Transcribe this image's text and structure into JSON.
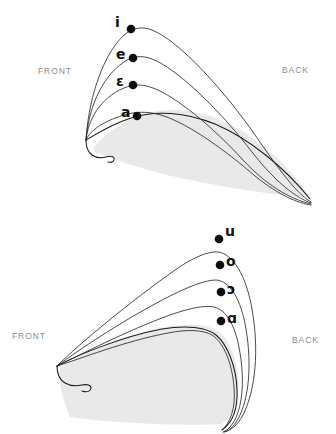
{
  "figure": {
    "background_color": "#ffffff",
    "tongue_fill_color": "#e9e9e9",
    "outline_color": "#1a1a1a",
    "curve_color": "#2a2a2a",
    "dot_color": "#0d0d0d",
    "orientation_label_color": "#8d8d8d",
    "vowel_label_color": "#101010"
  },
  "panels": [
    {
      "id": "front-vowels",
      "name": "Front vowel tongue positions",
      "orientation": {
        "front_label": "FRONT",
        "back_label": "BACK"
      },
      "vowels": [
        {
          "symbol": "i",
          "dot_x": 131,
          "dot_y": 29,
          "label_x": 115,
          "label_y": 15
        },
        {
          "symbol": "e",
          "dot_x": 133,
          "dot_y": 58,
          "label_x": 116,
          "label_y": 47
        },
        {
          "symbol": "ɛ",
          "dot_x": 133,
          "dot_y": 85,
          "label_x": 117,
          "label_y": 74
        },
        {
          "symbol": "a",
          "dot_x": 137,
          "dot_y": 116,
          "label_x": 121,
          "label_y": 104
        }
      ]
    },
    {
      "id": "back-vowels",
      "name": "Back vowel tongue positions",
      "orientation": {
        "front_label": "FRONT",
        "back_label": "BACK"
      },
      "vowels": [
        {
          "symbol": "u",
          "dot_x": 219,
          "dot_y": 239,
          "label_x": 225,
          "label_y": 224
        },
        {
          "symbol": "o",
          "dot_x": 220,
          "dot_y": 265,
          "label_x": 226,
          "label_y": 254
        },
        {
          "symbol": "ɔ",
          "dot_x": 221,
          "dot_y": 292,
          "label_x": 227,
          "label_y": 282
        },
        {
          "symbol": "ɑ",
          "dot_x": 221,
          "dot_y": 321,
          "label_x": 227,
          "label_y": 311
        }
      ]
    }
  ]
}
